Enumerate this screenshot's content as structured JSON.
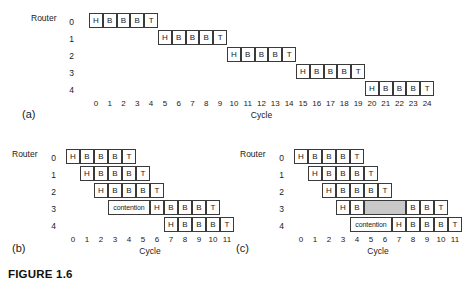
{
  "figure": {
    "caption": "FIGURE 1.6",
    "router_label": "Router",
    "cycle_label": "Cycle",
    "colors": {
      "cell_border": "#3a3a3a",
      "cell_fill": "#ffffff",
      "bubble_fill": "#c9c9c9",
      "text": "#1a1a1a",
      "background": "#ffffff"
    }
  },
  "panels": [
    {
      "id": "(a)",
      "name": "store-and-forward",
      "router_label": "Router",
      "cycle_label": "Cycle",
      "row_labels": [
        "0",
        "1",
        "2",
        "3",
        "4"
      ],
      "ticks": [
        "0",
        "1",
        "2",
        "3",
        "4",
        "5",
        "6",
        "7",
        "8",
        "9",
        "10",
        "11",
        "12",
        "13",
        "14",
        "15",
        "16",
        "17",
        "18",
        "19",
        "20",
        "21",
        "22",
        "23",
        "24"
      ],
      "tick_min": 0,
      "tick_max": 24,
      "rows": [
        {
          "row": 0,
          "cells": [
            {
              "start": 0,
              "span": 1,
              "label": "H",
              "shaded": false
            },
            {
              "start": 1,
              "span": 1,
              "label": "B",
              "shaded": false
            },
            {
              "start": 2,
              "span": 1,
              "label": "B",
              "shaded": false
            },
            {
              "start": 3,
              "span": 1,
              "label": "B",
              "shaded": false
            },
            {
              "start": 4,
              "span": 1,
              "label": "T",
              "shaded": false
            }
          ]
        },
        {
          "row": 1,
          "cells": [
            {
              "start": 5,
              "span": 1,
              "label": "H",
              "shaded": false
            },
            {
              "start": 6,
              "span": 1,
              "label": "B",
              "shaded": false
            },
            {
              "start": 7,
              "span": 1,
              "label": "B",
              "shaded": false
            },
            {
              "start": 8,
              "span": 1,
              "label": "B",
              "shaded": false
            },
            {
              "start": 9,
              "span": 1,
              "label": "T",
              "shaded": false
            }
          ]
        },
        {
          "row": 2,
          "cells": [
            {
              "start": 10,
              "span": 1,
              "label": "H",
              "shaded": false
            },
            {
              "start": 11,
              "span": 1,
              "label": "B",
              "shaded": false
            },
            {
              "start": 12,
              "span": 1,
              "label": "B",
              "shaded": false
            },
            {
              "start": 13,
              "span": 1,
              "label": "B",
              "shaded": false
            },
            {
              "start": 14,
              "span": 1,
              "label": "T",
              "shaded": false
            }
          ]
        },
        {
          "row": 3,
          "cells": [
            {
              "start": 15,
              "span": 1,
              "label": "H",
              "shaded": false
            },
            {
              "start": 16,
              "span": 1,
              "label": "B",
              "shaded": false
            },
            {
              "start": 17,
              "span": 1,
              "label": "B",
              "shaded": false
            },
            {
              "start": 18,
              "span": 1,
              "label": "B",
              "shaded": false
            },
            {
              "start": 19,
              "span": 1,
              "label": "T",
              "shaded": false
            }
          ]
        },
        {
          "row": 4,
          "cells": [
            {
              "start": 20,
              "span": 1,
              "label": "H",
              "shaded": false
            },
            {
              "start": 21,
              "span": 1,
              "label": "B",
              "shaded": false
            },
            {
              "start": 22,
              "span": 1,
              "label": "B",
              "shaded": false
            },
            {
              "start": 23,
              "span": 1,
              "label": "B",
              "shaded": false
            },
            {
              "start": 24,
              "span": 1,
              "label": "T",
              "shaded": false
            }
          ]
        }
      ]
    },
    {
      "id": "(b)",
      "name": "wormhole-contention-blocking",
      "router_label": "Router",
      "cycle_label": "Cycle",
      "row_labels": [
        "0",
        "1",
        "2",
        "3",
        "4"
      ],
      "ticks": [
        "0",
        "1",
        "2",
        "3",
        "4",
        "5",
        "6",
        "7",
        "8",
        "9",
        "10",
        "11"
      ],
      "tick_min": 0,
      "tick_max": 11,
      "rows": [
        {
          "row": 0,
          "cells": [
            {
              "start": 0,
              "span": 1,
              "label": "H",
              "shaded": false
            },
            {
              "start": 1,
              "span": 1,
              "label": "B",
              "shaded": false
            },
            {
              "start": 2,
              "span": 1,
              "label": "B",
              "shaded": false
            },
            {
              "start": 3,
              "span": 1,
              "label": "B",
              "shaded": false
            },
            {
              "start": 4,
              "span": 1,
              "label": "T",
              "shaded": false
            }
          ]
        },
        {
          "row": 1,
          "cells": [
            {
              "start": 1,
              "span": 1,
              "label": "H",
              "shaded": false
            },
            {
              "start": 2,
              "span": 1,
              "label": "B",
              "shaded": false
            },
            {
              "start": 3,
              "span": 1,
              "label": "B",
              "shaded": false
            },
            {
              "start": 4,
              "span": 1,
              "label": "B",
              "shaded": false
            },
            {
              "start": 5,
              "span": 1,
              "label": "T",
              "shaded": false
            }
          ]
        },
        {
          "row": 2,
          "cells": [
            {
              "start": 2,
              "span": 1,
              "label": "H",
              "shaded": false
            },
            {
              "start": 3,
              "span": 1,
              "label": "B",
              "shaded": false
            },
            {
              "start": 4,
              "span": 1,
              "label": "B",
              "shaded": false
            },
            {
              "start": 5,
              "span": 1,
              "label": "B",
              "shaded": false
            },
            {
              "start": 6,
              "span": 1,
              "label": "T",
              "shaded": false
            }
          ]
        },
        {
          "row": 3,
          "cells": [
            {
              "start": 3,
              "span": 3,
              "label": "contention",
              "shaded": false
            },
            {
              "start": 6,
              "span": 1,
              "label": "H",
              "shaded": false
            },
            {
              "start": 7,
              "span": 1,
              "label": "B",
              "shaded": false
            },
            {
              "start": 8,
              "span": 1,
              "label": "B",
              "shaded": false
            },
            {
              "start": 9,
              "span": 1,
              "label": "B",
              "shaded": false
            },
            {
              "start": 10,
              "span": 1,
              "label": "T",
              "shaded": false
            }
          ]
        },
        {
          "row": 4,
          "cells": [
            {
              "start": 7,
              "span": 1,
              "label": "H",
              "shaded": false
            },
            {
              "start": 8,
              "span": 1,
              "label": "B",
              "shaded": false
            },
            {
              "start": 9,
              "span": 1,
              "label": "B",
              "shaded": false
            },
            {
              "start": 10,
              "span": 1,
              "label": "B",
              "shaded": false
            },
            {
              "start": 11,
              "span": 1,
              "label": "T",
              "shaded": false
            }
          ]
        }
      ]
    },
    {
      "id": "(c)",
      "name": "virtual-cut-through-bubble",
      "router_label": "Router",
      "cycle_label": "Cycle",
      "row_labels": [
        "0",
        "1",
        "2",
        "3",
        "4"
      ],
      "ticks": [
        "0",
        "1",
        "2",
        "3",
        "4",
        "5",
        "6",
        "7",
        "8",
        "9",
        "10",
        "11"
      ],
      "tick_min": 0,
      "tick_max": 11,
      "rows": [
        {
          "row": 0,
          "cells": [
            {
              "start": 0,
              "span": 1,
              "label": "H",
              "shaded": false
            },
            {
              "start": 1,
              "span": 1,
              "label": "B",
              "shaded": false
            },
            {
              "start": 2,
              "span": 1,
              "label": "B",
              "shaded": false
            },
            {
              "start": 3,
              "span": 1,
              "label": "B",
              "shaded": false
            },
            {
              "start": 4,
              "span": 1,
              "label": "T",
              "shaded": false
            }
          ]
        },
        {
          "row": 1,
          "cells": [
            {
              "start": 1,
              "span": 1,
              "label": "H",
              "shaded": false
            },
            {
              "start": 2,
              "span": 1,
              "label": "B",
              "shaded": false
            },
            {
              "start": 3,
              "span": 1,
              "label": "B",
              "shaded": false
            },
            {
              "start": 4,
              "span": 1,
              "label": "B",
              "shaded": false
            },
            {
              "start": 5,
              "span": 1,
              "label": "T",
              "shaded": false
            }
          ]
        },
        {
          "row": 2,
          "cells": [
            {
              "start": 2,
              "span": 1,
              "label": "H",
              "shaded": false
            },
            {
              "start": 3,
              "span": 1,
              "label": "B",
              "shaded": false
            },
            {
              "start": 4,
              "span": 1,
              "label": "B",
              "shaded": false
            },
            {
              "start": 5,
              "span": 1,
              "label": "B",
              "shaded": false
            },
            {
              "start": 6,
              "span": 1,
              "label": "T",
              "shaded": false
            }
          ]
        },
        {
          "row": 3,
          "cells": [
            {
              "start": 3,
              "span": 1,
              "label": "H",
              "shaded": false
            },
            {
              "start": 4,
              "span": 1,
              "label": "B",
              "shaded": false
            },
            {
              "start": 5,
              "span": 3,
              "label": "",
              "shaded": true
            },
            {
              "start": 8,
              "span": 1,
              "label": "B",
              "shaded": false
            },
            {
              "start": 9,
              "span": 1,
              "label": "B",
              "shaded": false
            },
            {
              "start": 10,
              "span": 1,
              "label": "T",
              "shaded": false
            }
          ]
        },
        {
          "row": 4,
          "cells": [
            {
              "start": 4,
              "span": 3,
              "label": "contention",
              "shaded": false
            },
            {
              "start": 7,
              "span": 1,
              "label": "H",
              "shaded": false
            },
            {
              "start": 8,
              "span": 1,
              "label": "B",
              "shaded": false
            },
            {
              "start": 9,
              "span": 1,
              "label": "B",
              "shaded": false
            },
            {
              "start": 10,
              "span": 1,
              "label": "B",
              "shaded": false
            },
            {
              "start": 11,
              "span": 1,
              "label": "T",
              "shaded": false
            }
          ]
        }
      ]
    }
  ]
}
